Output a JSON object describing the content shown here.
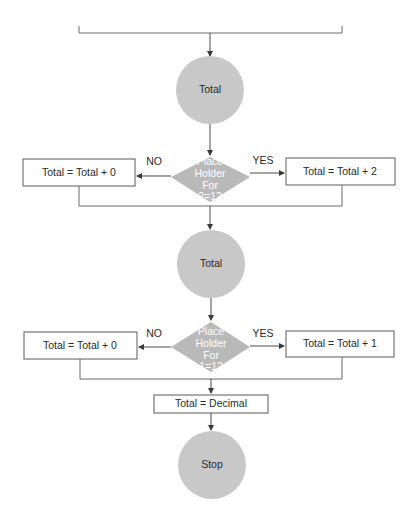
{
  "diagram": {
    "type": "flowchart",
    "colors": {
      "circle_fill": "#c8c8c8",
      "diamond_fill": "#b9b9b9",
      "diamond_text": "#ffffff",
      "box_border": "#5a5a5a",
      "line": "#4a4a4a",
      "text": "#2a2a2a"
    },
    "nodes": {
      "total_1": {
        "shape": "circle",
        "label": "Total"
      },
      "decision_1": {
        "shape": "diamond",
        "lines": [
          "Place",
          "Holder",
          "For",
          "2=1?"
        ]
      },
      "no_1": {
        "shape": "rect",
        "label": "Total = Total + 0"
      },
      "yes_1": {
        "shape": "rect",
        "label": "Total = Total + 2"
      },
      "total_2": {
        "shape": "circle",
        "label": "Total"
      },
      "decision_2": {
        "shape": "diamond",
        "lines": [
          "Place",
          "Holder",
          "For",
          "1=1?"
        ]
      },
      "no_2": {
        "shape": "rect",
        "label": "Total = Total + 0"
      },
      "yes_2": {
        "shape": "rect",
        "label": "Total = Total + 1"
      },
      "assign_decimal": {
        "shape": "rect",
        "label": "Total = Decimal"
      },
      "stop": {
        "shape": "circle",
        "label": "Stop"
      }
    },
    "branch_labels": {
      "decision_1_no": "NO",
      "decision_1_yes": "YES",
      "decision_2_no": "NO",
      "decision_2_yes": "YES"
    },
    "edges": [
      {
        "from": "top_merge",
        "to": "total_1"
      },
      {
        "from": "total_1",
        "to": "decision_1"
      },
      {
        "from": "decision_1",
        "to": "no_1",
        "label": "NO"
      },
      {
        "from": "decision_1",
        "to": "yes_1",
        "label": "YES"
      },
      {
        "from": "no_1",
        "to": "merge_1"
      },
      {
        "from": "yes_1",
        "to": "merge_1"
      },
      {
        "from": "merge_1",
        "to": "total_2"
      },
      {
        "from": "total_2",
        "to": "decision_2"
      },
      {
        "from": "decision_2",
        "to": "no_2",
        "label": "NO"
      },
      {
        "from": "decision_2",
        "to": "yes_2",
        "label": "YES"
      },
      {
        "from": "no_2",
        "to": "merge_2"
      },
      {
        "from": "yes_2",
        "to": "merge_2"
      },
      {
        "from": "merge_2",
        "to": "assign_decimal"
      },
      {
        "from": "assign_decimal",
        "to": "stop"
      }
    ]
  }
}
